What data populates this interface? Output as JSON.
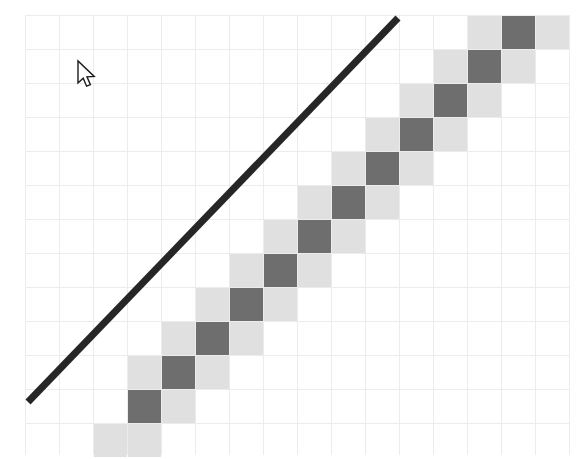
{
  "app": {
    "title": "Diagonal Heatmap with Reference Line",
    "background_color": "#ffffff"
  },
  "cursor": {
    "type": "arrow-pointer",
    "x": 78,
    "y": 61,
    "label": "mouse-cursor"
  },
  "chart_data": {
    "type": "heatmap",
    "title": "",
    "subtitle": "",
    "xlabel": "",
    "ylabel": "",
    "grid": true,
    "legend": null,
    "annotations": [
      {
        "name": "diagonal-reference-line",
        "type": "line",
        "x1": 28,
        "y1": 402,
        "x2": 398,
        "y2": 18,
        "color": "#262626",
        "width": 7
      }
    ],
    "axis": {
      "x_range": [
        0,
        15
      ],
      "y_range": [
        0,
        13
      ],
      "x_ticks": [
        0,
        1,
        2,
        3,
        4,
        5,
        6,
        7,
        8,
        9,
        10,
        11,
        12,
        13,
        14,
        15
      ],
      "y_ticks": [
        0,
        1,
        2,
        3,
        4,
        5,
        6,
        7,
        8,
        9,
        10,
        11,
        12,
        13
      ],
      "x_tick_labels": [],
      "y_tick_labels": []
    },
    "grid_geometry": {
      "origin_x": 25,
      "origin_y": 15,
      "cell_size": 34,
      "cols": 16,
      "rows": 13,
      "grid_color": "#ececec"
    },
    "colors": {
      "dark": "#6e6e6e",
      "light": "#e0e0e0",
      "empty": "#ffffff",
      "line": "#262626"
    },
    "colorscale": [
      {
        "name": "empty",
        "value": 0,
        "hex": "#ffffff"
      },
      {
        "name": "light",
        "value": 1,
        "hex": "#e0e0e0"
      },
      {
        "name": "dark",
        "value": 2,
        "hex": "#6e6e6e"
      }
    ],
    "cells": [
      {
        "col": 3,
        "row": 11,
        "value": 2
      },
      {
        "col": 2,
        "row": 12,
        "value": 1
      },
      {
        "col": 4,
        "row": 11,
        "value": 1
      },
      {
        "col": 3,
        "row": 12,
        "value": 1
      },
      {
        "col": 4,
        "row": 10,
        "value": 2
      },
      {
        "col": 3,
        "row": 10,
        "value": 1
      },
      {
        "col": 5,
        "row": 10,
        "value": 1
      },
      {
        "col": 4,
        "row": 9,
        "value": 1
      },
      {
        "col": 5,
        "row": 9,
        "value": 2
      },
      {
        "col": 6,
        "row": 9,
        "value": 1
      },
      {
        "col": 5,
        "row": 8,
        "value": 1
      },
      {
        "col": 6,
        "row": 8,
        "value": 2
      },
      {
        "col": 7,
        "row": 8,
        "value": 1
      },
      {
        "col": 6,
        "row": 7,
        "value": 1
      },
      {
        "col": 7,
        "row": 7,
        "value": 2
      },
      {
        "col": 8,
        "row": 7,
        "value": 1
      },
      {
        "col": 7,
        "row": 6,
        "value": 1
      },
      {
        "col": 8,
        "row": 6,
        "value": 2
      },
      {
        "col": 9,
        "row": 6,
        "value": 1
      },
      {
        "col": 8,
        "row": 5,
        "value": 1
      },
      {
        "col": 9,
        "row": 5,
        "value": 2
      },
      {
        "col": 10,
        "row": 5,
        "value": 1
      },
      {
        "col": 9,
        "row": 4,
        "value": 1
      },
      {
        "col": 10,
        "row": 4,
        "value": 2
      },
      {
        "col": 11,
        "row": 4,
        "value": 1
      },
      {
        "col": 10,
        "row": 3,
        "value": 1
      },
      {
        "col": 11,
        "row": 3,
        "value": 2
      },
      {
        "col": 12,
        "row": 3,
        "value": 1
      },
      {
        "col": 11,
        "row": 2,
        "value": 1
      },
      {
        "col": 12,
        "row": 2,
        "value": 2
      },
      {
        "col": 13,
        "row": 2,
        "value": 1
      },
      {
        "col": 12,
        "row": 1,
        "value": 1
      },
      {
        "col": 13,
        "row": 1,
        "value": 2
      },
      {
        "col": 14,
        "row": 1,
        "value": 1
      },
      {
        "col": 13,
        "row": 0,
        "value": 1
      },
      {
        "col": 14,
        "row": 0,
        "value": 2
      },
      {
        "col": 15,
        "row": 0,
        "value": 1
      }
    ]
  }
}
